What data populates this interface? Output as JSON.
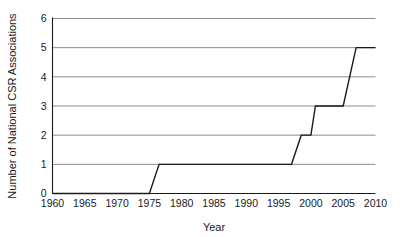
{
  "chart_data": {
    "type": "line",
    "title": "",
    "xlabel": "Year",
    "ylabel": "Number of National CSR Associations",
    "xlim": [
      1960,
      2010
    ],
    "ylim": [
      0,
      6
    ],
    "grid": true,
    "legend": "none",
    "line_style": "step",
    "xticks": [
      1960,
      1965,
      1970,
      1975,
      1980,
      1985,
      1990,
      1995,
      2000,
      2005,
      2010
    ],
    "yticks": [
      0,
      1,
      2,
      3,
      4,
      5,
      6
    ],
    "x": [
      1960,
      1975,
      1976.5,
      1997,
      1998.5,
      2000,
      2000.7,
      2005,
      2007,
      2010
    ],
    "values": [
      0,
      0,
      1,
      1,
      2,
      2,
      3,
      3,
      5,
      5
    ],
    "series": [
      {
        "name": "National CSR Associations",
        "x": [
          1960,
          1975,
          1976.5,
          1997,
          1998.5,
          2000,
          2000.7,
          2005,
          2007,
          2010
        ],
        "values": [
          0,
          0,
          1,
          1,
          2,
          2,
          3,
          3,
          5,
          5
        ]
      }
    ],
    "colors": {
      "line": "#1a1a1a",
      "grid": "#8c8c8c",
      "axis": "#1a1a1a",
      "background": "#ffffff"
    }
  },
  "axis": {
    "x_title": "Year",
    "y_title": "Number of National CSR Associations",
    "x_tick_labels": [
      "1960",
      "1965",
      "1970",
      "1975",
      "1980",
      "1985",
      "1990",
      "1995",
      "2000",
      "2005",
      "2010"
    ],
    "y_tick_labels": [
      "0",
      "1",
      "2",
      "3",
      "4",
      "5",
      "6"
    ]
  }
}
